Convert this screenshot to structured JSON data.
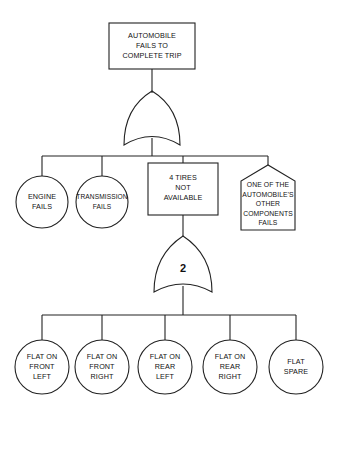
{
  "diagram": {
    "type": "fault-tree",
    "top_event": {
      "label_lines": [
        "AUTOMOBILE",
        "FAILS TO",
        "COMPLETE TRIP"
      ]
    },
    "top_gate": {
      "type": "OR",
      "label": ""
    },
    "level1": [
      {
        "shape": "circle",
        "label_lines": [
          "ENGINE",
          "FAILS"
        ]
      },
      {
        "shape": "circle",
        "label_lines": [
          "TRANSMISSION",
          "FAILS"
        ]
      },
      {
        "shape": "rectangle",
        "label_lines": [
          "4 TIRES",
          "NOT",
          "AVAILABLE"
        ]
      },
      {
        "shape": "house",
        "label_lines": [
          "ONE OF THE",
          "AUTOMOBILE'S",
          "OTHER",
          "COMPONENTS",
          "FAILS"
        ]
      }
    ],
    "sub_gate": {
      "type": "VOTING-OR",
      "label": "2"
    },
    "level2": [
      {
        "shape": "circle",
        "label_lines": [
          "FLAT ON",
          "FRONT",
          "LEFT"
        ]
      },
      {
        "shape": "circle",
        "label_lines": [
          "FLAT ON",
          "FRONT",
          "RIGHT"
        ]
      },
      {
        "shape": "circle",
        "label_lines": [
          "FLAT ON",
          "REAR",
          "LEFT"
        ]
      },
      {
        "shape": "circle",
        "label_lines": [
          "FLAT ON",
          "REAR",
          "RIGHT"
        ]
      },
      {
        "shape": "circle",
        "label_lines": [
          "FLAT",
          "SPARE"
        ]
      }
    ]
  }
}
